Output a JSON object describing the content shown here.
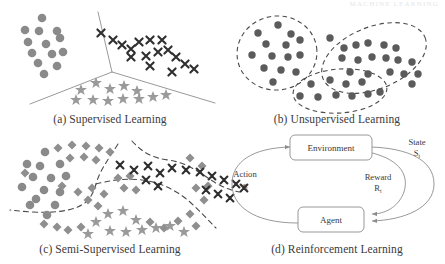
{
  "figure": {
    "header_faint_text": "MACHINE LEARNING",
    "panels": [
      {
        "id": "a",
        "caption": "(a) Supervised Learning"
      },
      {
        "id": "b",
        "caption": "(b) Unsupervised Learning"
      },
      {
        "id": "c",
        "caption": "(c) Semi-Supervised Learning"
      },
      {
        "id": "d",
        "caption": "(d) Reinforcement Learning"
      }
    ]
  },
  "colors": {
    "circle_fill": "#8a8a8a",
    "star_fill": "#9a9a9a",
    "cross_stroke": "#2f2f2f",
    "diamond_fill": "#8f8f8f",
    "dot_fill": "#5b5b5b",
    "line_stroke": "#8d8d8d",
    "dashed_stroke": "#4a4a4a",
    "text": "#3a3a3a"
  },
  "panel_a": {
    "boundary_type": "solid-y-partition",
    "classes": [
      {
        "name": "class-circles",
        "marker": "circle"
      },
      {
        "name": "class-crosses",
        "marker": "cross"
      },
      {
        "name": "class-stars",
        "marker": "star"
      }
    ],
    "circles": [
      [
        42,
        18
      ],
      [
        25,
        30
      ],
      [
        39,
        31
      ],
      [
        57,
        31
      ],
      [
        60,
        38
      ],
      [
        28,
        42
      ],
      [
        46,
        44
      ],
      [
        32,
        53
      ],
      [
        52,
        54
      ],
      [
        63,
        52
      ],
      [
        38,
        63
      ],
      [
        57,
        66
      ],
      [
        44,
        74
      ],
      [
        30,
        46
      ]
    ],
    "crosses": [
      [
        101,
        33
      ],
      [
        113,
        40
      ],
      [
        122,
        45
      ],
      [
        131,
        49
      ],
      [
        139,
        42
      ],
      [
        150,
        40
      ],
      [
        162,
        40
      ],
      [
        131,
        57
      ],
      [
        146,
        56
      ],
      [
        158,
        52
      ],
      [
        168,
        50
      ],
      [
        150,
        66
      ],
      [
        176,
        57
      ],
      [
        185,
        64
      ],
      [
        194,
        69
      ],
      [
        172,
        72
      ]
    ],
    "stars": [
      [
        81,
        90
      ],
      [
        96,
        83
      ],
      [
        110,
        89
      ],
      [
        124,
        86
      ],
      [
        137,
        91
      ],
      [
        76,
        100
      ],
      [
        93,
        100
      ],
      [
        108,
        101
      ],
      [
        123,
        99
      ],
      [
        139,
        99
      ],
      [
        153,
        97
      ],
      [
        166,
        95
      ]
    ]
  },
  "panel_b": {
    "boundary_type": "dashed-cluster-outlines",
    "clusters": [
      {
        "name": "cluster-left",
        "dots": [
          [
            278,
            25
          ],
          [
            258,
            33
          ],
          [
            291,
            34
          ],
          [
            266,
            44
          ],
          [
            286,
            45
          ],
          [
            300,
            40
          ],
          [
            252,
            55
          ],
          [
            272,
            56
          ],
          [
            288,
            57
          ],
          [
            300,
            55
          ],
          [
            264,
            68
          ],
          [
            281,
            70
          ],
          [
            296,
            72
          ],
          [
            273,
            82
          ]
        ]
      },
      {
        "name": "cluster-right",
        "dots": [
          [
            330,
            38
          ],
          [
            344,
            48
          ],
          [
            356,
            45
          ],
          [
            368,
            43
          ],
          [
            384,
            45
          ],
          [
            396,
            48
          ],
          [
            342,
            58
          ],
          [
            358,
            60
          ],
          [
            372,
            57
          ],
          [
            386,
            58
          ],
          [
            398,
            60
          ],
          [
            412,
            62
          ],
          [
            350,
            72
          ],
          [
            368,
            74
          ],
          [
            390,
            72
          ],
          [
            404,
            74
          ],
          [
            418,
            74
          ],
          [
            412,
            84
          ]
        ]
      },
      {
        "name": "cluster-bottom",
        "dots": [
          [
            311,
            84
          ],
          [
            330,
            80
          ],
          [
            346,
            84
          ],
          [
            362,
            82
          ],
          [
            300,
            96
          ],
          [
            318,
            97
          ],
          [
            336,
            95
          ],
          [
            352,
            96
          ],
          [
            368,
            94
          ],
          [
            380,
            92
          ]
        ]
      }
    ]
  },
  "panel_c": {
    "boundary_type": "dashed-partition",
    "classes": [
      {
        "name": "labeled-circles",
        "marker": "circle"
      },
      {
        "name": "labeled-crosses",
        "marker": "cross"
      },
      {
        "name": "labeled-stars",
        "marker": "star"
      },
      {
        "name": "unlabeled-diamonds",
        "marker": "diamond"
      }
    ],
    "circles": [
      [
        45,
        152
      ],
      [
        27,
        164
      ],
      [
        40,
        166
      ],
      [
        60,
        164
      ],
      [
        33,
        177
      ],
      [
        51,
        178
      ],
      [
        66,
        176
      ],
      [
        22,
        187
      ],
      [
        44,
        190
      ],
      [
        60,
        192
      ],
      [
        36,
        199
      ],
      [
        55,
        205
      ],
      [
        47,
        215
      ],
      [
        30,
        205
      ]
    ],
    "diamonds": [
      [
        58,
        148
      ],
      [
        72,
        145
      ],
      [
        86,
        146
      ],
      [
        99,
        148
      ],
      [
        70,
        158
      ],
      [
        84,
        157
      ],
      [
        96,
        160
      ],
      [
        25,
        173
      ],
      [
        110,
        152
      ],
      [
        62,
        186
      ],
      [
        78,
        192
      ],
      [
        92,
        188
      ],
      [
        104,
        194
      ],
      [
        88,
        200
      ],
      [
        98,
        206
      ],
      [
        44,
        224
      ],
      [
        57,
        227
      ],
      [
        68,
        230
      ],
      [
        81,
        227
      ],
      [
        150,
        222
      ],
      [
        164,
        228
      ],
      [
        178,
        221
      ],
      [
        190,
        214
      ],
      [
        196,
        226
      ],
      [
        204,
        200
      ],
      [
        196,
        188
      ],
      [
        208,
        186
      ],
      [
        118,
        178
      ],
      [
        130,
        176
      ],
      [
        124,
        188
      ],
      [
        136,
        190
      ],
      [
        190,
        158
      ],
      [
        202,
        166
      ]
    ],
    "stars": [
      [
        108,
        214
      ],
      [
        96,
        222
      ],
      [
        123,
        211
      ],
      [
        136,
        220
      ],
      [
        110,
        231
      ],
      [
        126,
        232
      ],
      [
        142,
        230
      ],
      [
        156,
        228
      ],
      [
        170,
        226
      ],
      [
        184,
        232
      ],
      [
        88,
        234
      ],
      [
        102,
        236
      ]
    ],
    "crosses": [
      [
        120,
        165
      ],
      [
        134,
        170
      ],
      [
        148,
        166
      ],
      [
        160,
        173
      ],
      [
        146,
        180
      ],
      [
        158,
        186
      ],
      [
        172,
        168
      ],
      [
        186,
        170
      ],
      [
        200,
        172
      ],
      [
        212,
        176
      ],
      [
        224,
        180
      ],
      [
        236,
        184
      ],
      [
        206,
        190
      ],
      [
        218,
        194
      ],
      [
        230,
        198
      ],
      [
        244,
        188
      ]
    ]
  },
  "panel_d": {
    "nodes": [
      {
        "id": "environment",
        "label": "Environment"
      },
      {
        "id": "agent",
        "label": "Agent"
      }
    ],
    "edges": [
      {
        "id": "action",
        "label": "Action",
        "symbol": "a",
        "subscript": "t",
        "from": "agent",
        "to": "environment"
      },
      {
        "id": "state",
        "label": "State",
        "symbol": "S",
        "subscript": "t",
        "from": "environment",
        "to": "agent"
      },
      {
        "id": "reward",
        "label": "Reward",
        "symbol": "R",
        "subscript": "t",
        "from": "environment",
        "to": "agent"
      }
    ]
  }
}
